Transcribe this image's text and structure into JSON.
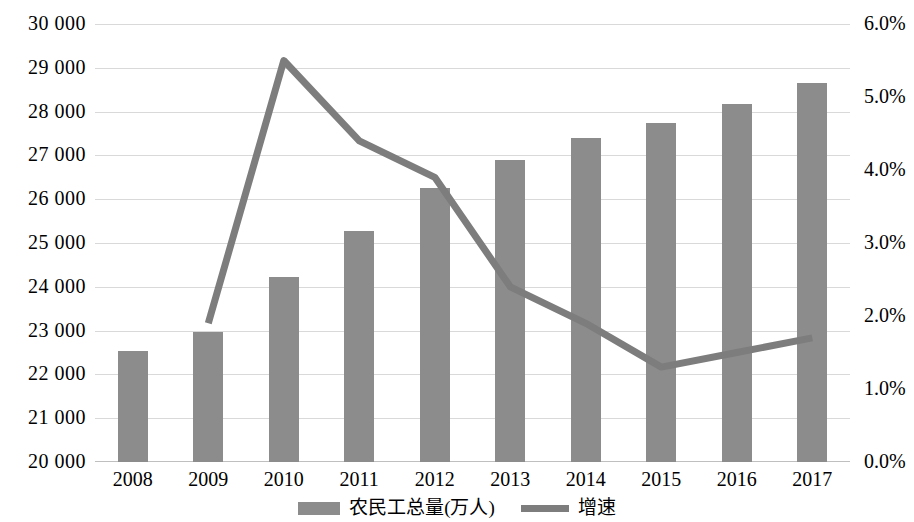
{
  "chart_data": {
    "type": "bar",
    "title": "",
    "xlabel": "",
    "ylabel": "",
    "categories": [
      "2008",
      "2009",
      "2010",
      "2011",
      "2012",
      "2013",
      "2014",
      "2015",
      "2016",
      "2017"
    ],
    "series": [
      {
        "name": "农民工总量(万人)",
        "type": "bar",
        "axis": "left",
        "color": "#8c8c8c",
        "values": [
          22542,
          22978,
          24223,
          25278,
          26261,
          26894,
          27395,
          27747,
          28171,
          28652
        ]
      },
      {
        "name": "增速",
        "type": "line",
        "axis": "right",
        "color": "#7d7d7d",
        "values": [
          null,
          1.9,
          5.5,
          4.4,
          3.9,
          2.4,
          1.9,
          1.3,
          1.5,
          1.7
        ]
      }
    ],
    "ylim": [
      20000,
      30000
    ],
    "yticks": [
      "20 000",
      "21 000",
      "22 000",
      "23 000",
      "24 000",
      "25 000",
      "26 000",
      "27 000",
      "28 000",
      "29 000",
      "30 000"
    ],
    "y2lim": [
      0,
      6
    ],
    "y2ticks": [
      "0.0%",
      "1.0%",
      "2.0%",
      "3.0%",
      "4.0%",
      "5.0%",
      "6.0%"
    ],
    "grid": true,
    "legend_position": "bottom"
  },
  "legend": {
    "items": [
      {
        "label": "农民工总量(万人)",
        "marker": "bar-swatch"
      },
      {
        "label": "增速",
        "marker": "line-swatch"
      }
    ]
  }
}
